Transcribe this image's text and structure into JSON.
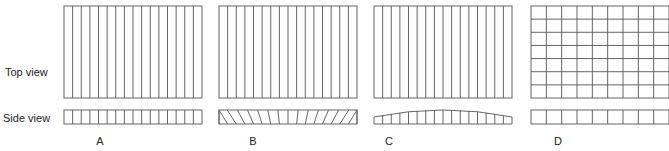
{
  "row_labels": {
    "top": "Top view",
    "side": "Side view"
  },
  "colors": {
    "line": "#555555",
    "text": "#222222",
    "background": "#ffffff"
  },
  "panels": [
    {
      "label": "A",
      "x": 64,
      "top_pattern": "vertical-strips",
      "columns": 16,
      "rows": 1,
      "side_pattern": "vertical-cells"
    },
    {
      "label": "B",
      "x": 219,
      "top_pattern": "vertical-strips",
      "columns": 16,
      "rows": 1,
      "side_pattern": "slanted-lines"
    },
    {
      "label": "C",
      "x": 374,
      "top_pattern": "vertical-strips",
      "columns": 16,
      "rows": 1,
      "side_pattern": "arched-cells"
    },
    {
      "label": "D",
      "x": 531,
      "top_pattern": "grid",
      "columns": 9,
      "rows": 7,
      "side_pattern": "vertical-cells"
    }
  ],
  "geometry": {
    "panel_width": 138,
    "top_y": 6,
    "top_h": 92,
    "side_y": 110,
    "side_h": 14,
    "label_y": 145
  }
}
